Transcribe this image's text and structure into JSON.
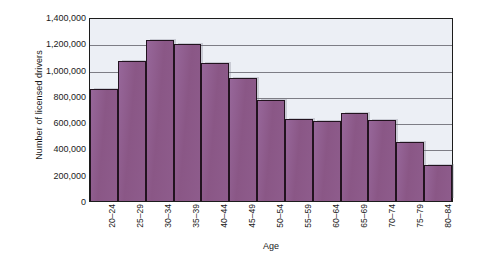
{
  "chart_data": {
    "type": "bar",
    "title": "",
    "xlabel": "Age",
    "ylabel": "Number of licensed drivers",
    "categories": [
      "20–24",
      "25–29",
      "30–34",
      "35–39",
      "40–44",
      "45–49",
      "50–54",
      "55–59",
      "60–64",
      "65–69",
      "70–74",
      "75–79",
      "80–84"
    ],
    "values": [
      850000,
      1065000,
      1225000,
      1195000,
      1050000,
      935000,
      770000,
      625000,
      610000,
      670000,
      618000,
      450000,
      275000
    ],
    "ylim": [
      0,
      1400000
    ],
    "ytick_values": [
      0,
      200000,
      400000,
      600000,
      800000,
      1000000,
      1200000,
      1400000
    ],
    "ytick_labels": [
      "0",
      "200,000",
      "400,000",
      "600,000",
      "800,000",
      "1,000,000",
      "1,200,000",
      "1,400,000"
    ],
    "grid": true,
    "grid_axis": "y",
    "legend": null,
    "bar_color": "#8b5a8a",
    "bar_edge_color": "#22131f",
    "plot_background": "#eceff5",
    "axis_color": "#1c1c1c",
    "gridline_color": "#7d7d85"
  }
}
